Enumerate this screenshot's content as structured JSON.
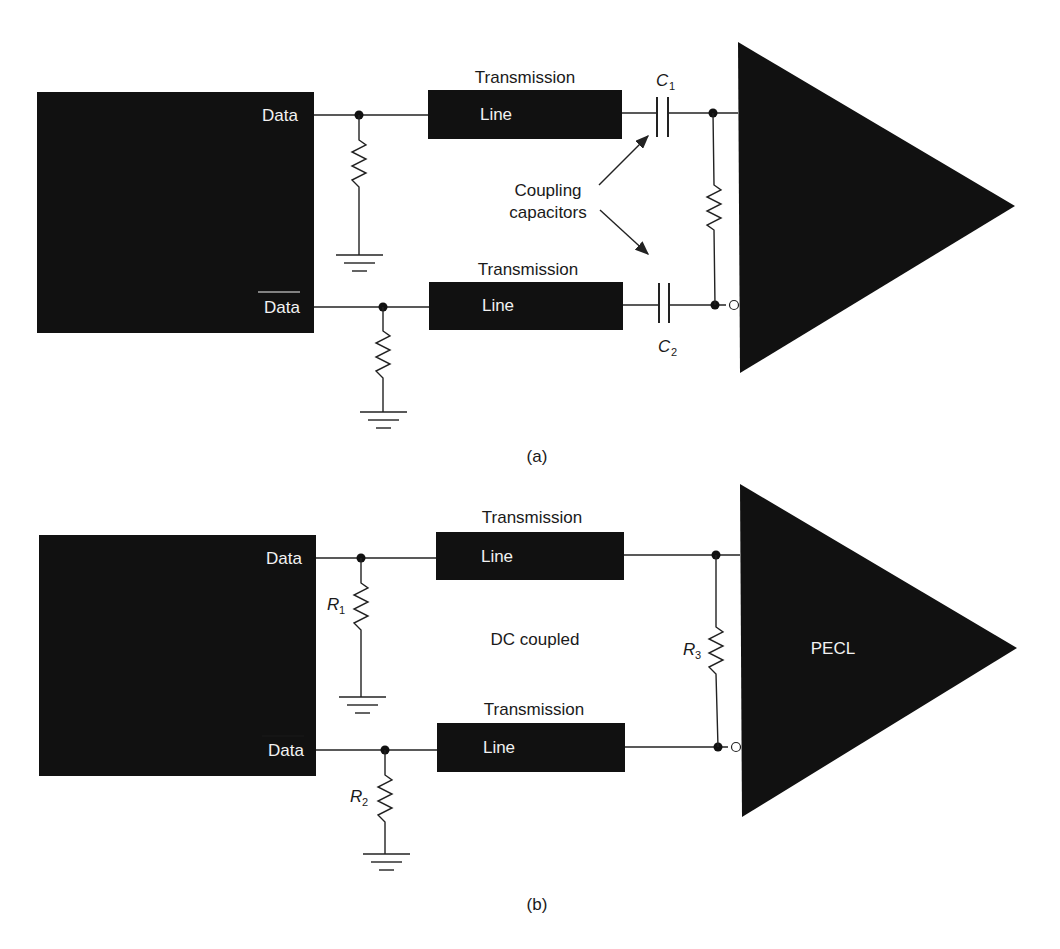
{
  "figure": {
    "panel_a": {
      "caption": "(a)",
      "driver_outputs": {
        "data": "Data",
        "data_bar": "Data"
      },
      "transmission_line_top": {
        "label_above": "Transmission",
        "label_inside": "Line"
      },
      "transmission_line_bottom": {
        "label_above": "Transmission",
        "label_inside": "Line"
      },
      "capacitors": {
        "c1": {
          "letter": "C",
          "sub": "1"
        },
        "c2": {
          "letter": "C",
          "sub": "2"
        }
      },
      "annotation": {
        "line1": "Coupling",
        "line2": "capacitors"
      }
    },
    "panel_b": {
      "caption": "(b)",
      "driver_outputs": {
        "data": "Data",
        "data_bar": "Data"
      },
      "transmission_line_top": {
        "label_above": "Transmission",
        "label_inside": "Line"
      },
      "transmission_line_bottom": {
        "label_above": "Transmission",
        "label_inside": "Line"
      },
      "resistors": {
        "r1": {
          "letter": "R",
          "sub": "1"
        },
        "r2": {
          "letter": "R",
          "sub": "2"
        },
        "r3": {
          "letter": "R",
          "sub": "3"
        }
      },
      "annotation": "DC coupled",
      "receiver_label": "PECL"
    }
  }
}
